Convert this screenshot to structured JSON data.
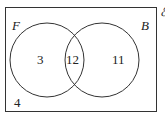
{
  "diagram": {
    "type": "venn",
    "universal_symbol": "ℰ",
    "sets": [
      {
        "label": "F",
        "only": "3"
      },
      {
        "label": "B",
        "only": "11"
      }
    ],
    "intersection": "12",
    "outside": "4"
  }
}
